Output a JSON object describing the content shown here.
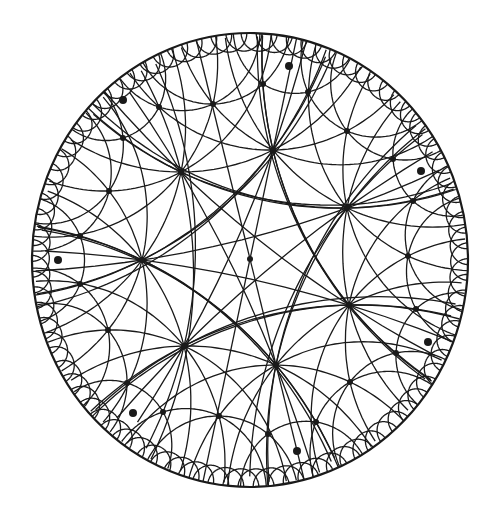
{
  "diagram": {
    "type": "hyperbolic-tiling-poincare-disk",
    "disk": {
      "cx": 250,
      "cy": 260,
      "rx": 218,
      "ry": 227
    },
    "line_color": "#1a1a1a",
    "boundary_width": 2.2,
    "line_width": 1.3,
    "center_vertex": {
      "x": 250,
      "y": 259
    },
    "vertices": [
      [
        250,
        259
      ],
      [
        142,
        260
      ],
      [
        347,
        208
      ],
      [
        349,
        305
      ],
      [
        273,
        150
      ],
      [
        181,
        172
      ],
      [
        184,
        346
      ],
      [
        276,
        365
      ],
      [
        408,
        256
      ],
      [
        413,
        201
      ],
      [
        416,
        309
      ],
      [
        393,
        159
      ],
      [
        396,
        353
      ],
      [
        347,
        131
      ],
      [
        350,
        382
      ],
      [
        80,
        236
      ],
      [
        80,
        284
      ],
      [
        109,
        191
      ],
      [
        108,
        330
      ],
      [
        123,
        138
      ],
      [
        127,
        383
      ],
      [
        159,
        107
      ],
      [
        163,
        412
      ],
      [
        213,
        104
      ],
      [
        219,
        416
      ],
      [
        263,
        84
      ],
      [
        268,
        434
      ],
      [
        308,
        92
      ],
      [
        316,
        422
      ]
    ],
    "marked_points": [
      [
        58,
        260
      ],
      [
        123,
        100
      ],
      [
        289,
        66
      ],
      [
        421,
        171
      ],
      [
        428,
        342
      ],
      [
        133,
        413
      ],
      [
        297,
        451
      ]
    ],
    "geodesic_pairs": [
      [
        [
          250,
          259
        ],
        [
          142,
          260
        ]
      ],
      [
        [
          250,
          259
        ],
        [
          347,
          208
        ]
      ],
      [
        [
          250,
          259
        ],
        [
          349,
          305
        ]
      ],
      [
        [
          250,
          259
        ],
        [
          273,
          150
        ]
      ],
      [
        [
          250,
          259
        ],
        [
          181,
          172
        ]
      ],
      [
        [
          250,
          259
        ],
        [
          184,
          346
        ]
      ],
      [
        [
          250,
          259
        ],
        [
          276,
          365
        ]
      ],
      [
        [
          142,
          260
        ],
        [
          347,
          208
        ]
      ],
      [
        [
          142,
          260
        ],
        [
          349,
          305
        ]
      ],
      [
        [
          347,
          208
        ],
        [
          276,
          365
        ]
      ],
      [
        [
          349,
          305
        ],
        [
          273,
          150
        ]
      ],
      [
        [
          273,
          150
        ],
        [
          184,
          346
        ]
      ],
      [
        [
          181,
          172
        ],
        [
          276,
          365
        ]
      ],
      [
        [
          181,
          172
        ],
        [
          349,
          305
        ]
      ],
      [
        [
          184,
          346
        ],
        [
          347,
          208
        ]
      ],
      [
        [
          142,
          260
        ],
        [
          273,
          150
        ]
      ],
      [
        [
          142,
          260
        ],
        [
          276,
          365
        ]
      ],
      [
        [
          181,
          172
        ],
        [
          347,
          208
        ]
      ],
      [
        [
          184,
          346
        ],
        [
          349,
          305
        ]
      ],
      [
        [
          273,
          150
        ],
        [
          181,
          172
        ]
      ],
      [
        [
          184,
          346
        ],
        [
          276,
          365
        ]
      ],
      [
        [
          142,
          260
        ],
        [
          181,
          172
        ]
      ],
      [
        [
          142,
          260
        ],
        [
          184,
          346
        ]
      ],
      [
        [
          347,
          208
        ],
        [
          349,
          305
        ]
      ],
      [
        [
          273,
          150
        ],
        [
          347,
          208
        ]
      ],
      [
        [
          276,
          365
        ],
        [
          349,
          305
        ]
      ],
      [
        [
          142,
          260
        ],
        [
          80,
          236
        ]
      ],
      [
        [
          142,
          260
        ],
        [
          80,
          284
        ]
      ],
      [
        [
          142,
          260
        ],
        [
          109,
          191
        ]
      ],
      [
        [
          142,
          260
        ],
        [
          108,
          330
        ]
      ],
      [
        [
          347,
          208
        ],
        [
          408,
          256
        ]
      ],
      [
        [
          347,
          208
        ],
        [
          413,
          201
        ]
      ],
      [
        [
          347,
          208
        ],
        [
          393,
          159
        ]
      ],
      [
        [
          347,
          208
        ],
        [
          347,
          131
        ]
      ],
      [
        [
          349,
          305
        ],
        [
          408,
          256
        ]
      ],
      [
        [
          349,
          305
        ],
        [
          416,
          309
        ]
      ],
      [
        [
          349,
          305
        ],
        [
          396,
          353
        ]
      ],
      [
        [
          349,
          305
        ],
        [
          350,
          382
        ]
      ],
      [
        [
          273,
          150
        ],
        [
          347,
          131
        ]
      ],
      [
        [
          273,
          150
        ],
        [
          263,
          84
        ]
      ],
      [
        [
          273,
          150
        ],
        [
          308,
          92
        ]
      ],
      [
        [
          273,
          150
        ],
        [
          213,
          104
        ]
      ],
      [
        [
          181,
          172
        ],
        [
          123,
          138
        ]
      ],
      [
        [
          181,
          172
        ],
        [
          109,
          191
        ]
      ],
      [
        [
          181,
          172
        ],
        [
          159,
          107
        ]
      ],
      [
        [
          181,
          172
        ],
        [
          213,
          104
        ]
      ],
      [
        [
          184,
          346
        ],
        [
          108,
          330
        ]
      ],
      [
        [
          184,
          346
        ],
        [
          127,
          383
        ]
      ],
      [
        [
          184,
          346
        ],
        [
          163,
          412
        ]
      ],
      [
        [
          184,
          346
        ],
        [
          219,
          416
        ]
      ],
      [
        [
          276,
          365
        ],
        [
          350,
          382
        ]
      ],
      [
        [
          276,
          365
        ],
        [
          268,
          434
        ]
      ],
      [
        [
          276,
          365
        ],
        [
          316,
          422
        ]
      ],
      [
        [
          276,
          365
        ],
        [
          219,
          416
        ]
      ],
      [
        [
          80,
          236
        ],
        [
          109,
          191
        ]
      ],
      [
        [
          80,
          284
        ],
        [
          108,
          330
        ]
      ],
      [
        [
          109,
          191
        ],
        [
          123,
          138
        ]
      ],
      [
        [
          108,
          330
        ],
        [
          127,
          383
        ]
      ],
      [
        [
          123,
          138
        ],
        [
          159,
          107
        ]
      ],
      [
        [
          127,
          383
        ],
        [
          163,
          412
        ]
      ],
      [
        [
          159,
          107
        ],
        [
          213,
          104
        ]
      ],
      [
        [
          163,
          412
        ],
        [
          219,
          416
        ]
      ],
      [
        [
          213,
          104
        ],
        [
          263,
          84
        ]
      ],
      [
        [
          219,
          416
        ],
        [
          268,
          434
        ]
      ],
      [
        [
          263,
          84
        ],
        [
          308,
          92
        ]
      ],
      [
        [
          268,
          434
        ],
        [
          316,
          422
        ]
      ],
      [
        [
          308,
          92
        ],
        [
          347,
          131
        ]
      ],
      [
        [
          316,
          422
        ],
        [
          350,
          382
        ]
      ],
      [
        [
          347,
          131
        ],
        [
          393,
          159
        ]
      ],
      [
        [
          350,
          382
        ],
        [
          396,
          353
        ]
      ],
      [
        [
          393,
          159
        ],
        [
          413,
          201
        ]
      ],
      [
        [
          396,
          353
        ],
        [
          416,
          309
        ]
      ],
      [
        [
          413,
          201
        ],
        [
          408,
          256
        ]
      ],
      [
        [
          416,
          309
        ],
        [
          408,
          256
        ]
      ],
      [
        [
          80,
          236
        ],
        [
          80,
          284
        ]
      ]
    ],
    "boundary_arc_count": 90
  }
}
